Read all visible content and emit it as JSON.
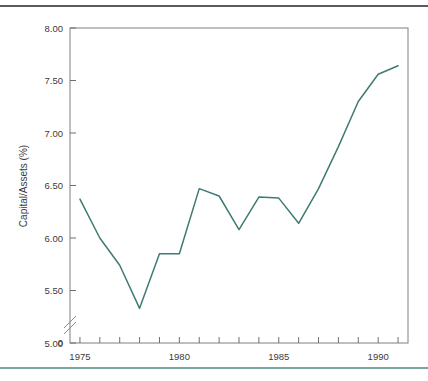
{
  "figure": {
    "top_rule_color": "#5a5a60",
    "bottom_rule_color": "#79a8a1",
    "background": "#ffffff"
  },
  "chart_data": {
    "type": "line",
    "title": "",
    "subtitle": "",
    "xlabel": "",
    "ylabel": "Capital/Assets (%)",
    "series_name": "Capital/Assets",
    "line_color": "#3d7b74",
    "grid": false,
    "legend": "none",
    "axis_break": true,
    "axis_break_note": "y-axis broken between 0 and 5.00",
    "xlim": [
      1974.5,
      1991.5
    ],
    "ylim": [
      5.0,
      8.0
    ],
    "x": [
      1975,
      1976,
      1977,
      1978,
      1979,
      1980,
      1981,
      1982,
      1983,
      1984,
      1985,
      1986,
      1987,
      1988,
      1989,
      1990,
      1991
    ],
    "values": [
      6.37,
      6.0,
      5.74,
      5.33,
      5.85,
      5.85,
      6.47,
      6.4,
      6.08,
      6.39,
      6.38,
      6.14,
      6.47,
      6.87,
      7.3,
      7.56,
      7.64
    ],
    "x_tick_values": [
      1975,
      1976,
      1977,
      1978,
      1979,
      1980,
      1981,
      1982,
      1983,
      1984,
      1985,
      1986,
      1987,
      1988,
      1989,
      1990,
      1991
    ],
    "x_tick_labels": [
      "1975",
      "",
      "",
      "",
      "",
      "1980",
      "",
      "",
      "",
      "",
      "1985",
      "",
      "",
      "",
      "",
      "1990",
      ""
    ],
    "y_tick_values": [
      5.0,
      5.5,
      6.0,
      6.5,
      7.0,
      7.5,
      8.0
    ],
    "y_tick_labels": [
      "5.00",
      "5.50",
      "6.00",
      "6.50",
      "7.00",
      "7.50",
      "8.00"
    ],
    "y_origin_label": "0"
  }
}
